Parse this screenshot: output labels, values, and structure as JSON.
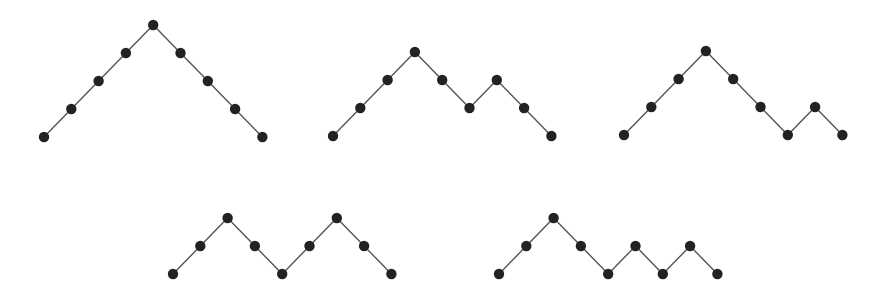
{
  "colors": {
    "line": "#555555",
    "node": "#222222",
    "background": "#ffffff"
  },
  "paths": [
    {
      "name": "path-uuuudddd",
      "steps": "UUUUDDDD",
      "heights": [
        0,
        1,
        2,
        3,
        4,
        3,
        2,
        1,
        0
      ]
    },
    {
      "name": "path-uuuddudd",
      "steps": "UUUDDUDD",
      "heights": [
        0,
        1,
        2,
        3,
        2,
        1,
        2,
        1,
        0
      ]
    },
    {
      "name": "path-uuudddud",
      "steps": "UUUDDDUD",
      "heights": [
        0,
        1,
        2,
        3,
        2,
        1,
        0,
        1,
        0
      ]
    },
    {
      "name": "path-uudduudd",
      "steps": "UUDDUUDD",
      "heights": [
        0,
        1,
        2,
        1,
        0,
        1,
        2,
        1,
        0
      ]
    },
    {
      "name": "path-uuddudud",
      "steps": "UUDDUDUD",
      "heights": [
        0,
        1,
        2,
        1,
        0,
        1,
        0,
        1,
        0
      ]
    }
  ]
}
